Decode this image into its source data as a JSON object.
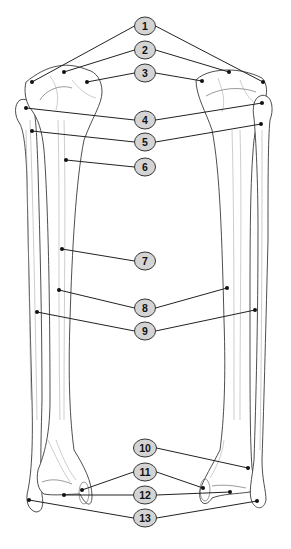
{
  "diagram": {
    "colors": {
      "label_fill": "#d4d4d4",
      "label_stroke": "#333333",
      "leader_line": "#222222",
      "bone_outline": "#3a3a3a",
      "background": "#ffffff"
    },
    "labels": [
      {
        "id": "1",
        "text": "1",
        "cx": 145,
        "cy": 26,
        "targets": [
          [
            32,
            82
          ],
          [
            263,
            82
          ]
        ]
      },
      {
        "id": "2",
        "text": "2",
        "cx": 145,
        "cy": 50,
        "targets": [
          [
            64,
            72
          ],
          [
            229,
            72
          ]
        ]
      },
      {
        "id": "3",
        "text": "3",
        "cx": 145,
        "cy": 73,
        "targets": [
          [
            87,
            82
          ],
          [
            202,
            81
          ]
        ]
      },
      {
        "id": "4",
        "text": "4",
        "cx": 145,
        "cy": 120,
        "targets": [
          [
            26,
            108
          ],
          [
            262,
            103
          ]
        ]
      },
      {
        "id": "5",
        "text": "5",
        "cx": 145,
        "cy": 142,
        "targets": [
          [
            32,
            131
          ],
          [
            261,
            124
          ]
        ]
      },
      {
        "id": "6",
        "text": "6",
        "cx": 145,
        "cy": 167,
        "targets": [
          [
            66,
            160
          ]
        ]
      },
      {
        "id": "7",
        "text": "7",
        "cx": 145,
        "cy": 261,
        "targets": [
          [
            62,
            249
          ]
        ]
      },
      {
        "id": "8",
        "text": "8",
        "cx": 145,
        "cy": 308,
        "targets": [
          [
            59,
            290
          ],
          [
            227,
            288
          ]
        ]
      },
      {
        "id": "9",
        "text": "9",
        "cx": 145,
        "cy": 331,
        "targets": [
          [
            37,
            312
          ],
          [
            255,
            310
          ]
        ]
      },
      {
        "id": "10",
        "text": "10",
        "cx": 145,
        "cy": 448,
        "targets": [
          [
            248,
            468
          ]
        ]
      },
      {
        "id": "11",
        "text": "11",
        "cx": 145,
        "cy": 472,
        "targets": [
          [
            82,
            490
          ],
          [
            203,
            488
          ]
        ]
      },
      {
        "id": "12",
        "text": "12",
        "cx": 145,
        "cy": 495,
        "targets": [
          [
            64,
            495
          ],
          [
            230,
            492
          ]
        ]
      },
      {
        "id": "13",
        "text": "13",
        "cx": 145,
        "cy": 518,
        "targets": [
          [
            29,
            500
          ],
          [
            257,
            501
          ]
        ]
      }
    ]
  }
}
